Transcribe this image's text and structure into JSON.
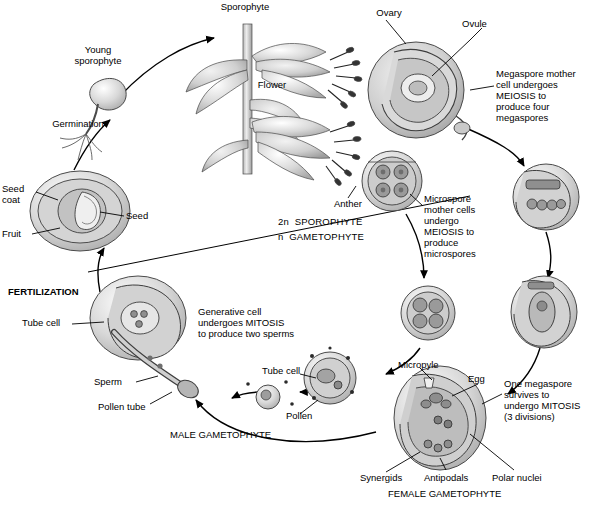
{
  "diagram": {
    "labels": [
      {
        "id": "sporophyte",
        "text": "Sporophyte",
        "x": 210,
        "y": 2,
        "w": 70,
        "align": "center",
        "bold": false,
        "italic": false
      },
      {
        "id": "ovary",
        "text": "Ovary",
        "x": 368,
        "y": 8,
        "w": 42,
        "align": "center",
        "bold": false,
        "italic": false
      },
      {
        "id": "ovule",
        "text": "Ovule",
        "x": 462,
        "y": 19,
        "w": 42,
        "align": "left",
        "bold": false,
        "italic": false
      },
      {
        "id": "young-sporophyte",
        "text": "Young\nsporophyte",
        "x": 63,
        "y": 45,
        "w": 70,
        "align": "center",
        "bold": false,
        "italic": false
      },
      {
        "id": "flower",
        "text": "Flower",
        "x": 248,
        "y": 80,
        "w": 48,
        "align": "center",
        "bold": false,
        "italic": false
      },
      {
        "id": "megaspore-mother-cell",
        "text": "Megaspore mother\ncell undergoes\nMEIOSIS to\nproduce four\nmegaspores",
        "x": 496,
        "y": 69,
        "w": 110,
        "align": "left",
        "bold": false,
        "italic": false
      },
      {
        "id": "germination",
        "text": "Germination",
        "x": 44,
        "y": 119,
        "w": 68,
        "align": "center",
        "bold": false,
        "italic": false
      },
      {
        "id": "seed-coat",
        "text": "Seed\ncoat",
        "x": 2,
        "y": 184,
        "w": 34,
        "align": "left",
        "bold": false,
        "italic": false
      },
      {
        "id": "seed",
        "text": "Seed",
        "x": 126,
        "y": 211,
        "w": 34,
        "align": "left",
        "bold": false,
        "italic": false
      },
      {
        "id": "fruit",
        "text": "Fruit",
        "x": 2,
        "y": 229,
        "w": 30,
        "align": "left",
        "bold": false,
        "italic": false
      },
      {
        "id": "anther",
        "text": "Anther",
        "x": 326,
        "y": 199,
        "w": 44,
        "align": "center",
        "bold": false,
        "italic": false
      },
      {
        "id": "microspore-mother-cells",
        "text": "Microspore\nmother cells\nundergo\nMEIOSIS to\nproduce\nmicrospores",
        "x": 424,
        "y": 194,
        "w": 72,
        "align": "left",
        "bold": false,
        "italic": false
      },
      {
        "id": "sporophyte-level",
        "text": "2n  SPOROPHYTE",
        "x": 278,
        "y": 217,
        "w": 104,
        "align": "left",
        "bold": false,
        "italic": false
      },
      {
        "id": "gametophyte-level",
        "text": "n  GAMETOPHYTE",
        "x": 278,
        "y": 232,
        "w": 104,
        "align": "left",
        "bold": false,
        "italic": false
      },
      {
        "id": "fertilization",
        "text": "FERTILIZATION",
        "x": 8,
        "y": 287,
        "w": 92,
        "align": "left",
        "bold": true,
        "italic": false
      },
      {
        "id": "generative-cell",
        "text": "Generative cell\nundergoes MITOSIS\nto produce two sperms",
        "x": 198,
        "y": 307,
        "w": 116,
        "align": "left",
        "bold": false,
        "italic": false
      },
      {
        "id": "tube-cell-left",
        "text": "Tube cell",
        "x": 22,
        "y": 318,
        "w": 52,
        "align": "left",
        "bold": false,
        "italic": false
      },
      {
        "id": "tube-cell-right",
        "text": "Tube cell",
        "x": 262,
        "y": 366,
        "w": 52,
        "align": "left",
        "bold": false,
        "italic": false
      },
      {
        "id": "micropyle",
        "text": "Micropyle",
        "x": 398,
        "y": 360,
        "w": 58,
        "align": "left",
        "bold": false,
        "italic": false
      },
      {
        "id": "egg",
        "text": "Egg",
        "x": 468,
        "y": 374,
        "w": 28,
        "align": "left",
        "bold": false,
        "italic": false
      },
      {
        "id": "sperm",
        "text": "Sperm",
        "x": 94,
        "y": 377,
        "w": 42,
        "align": "left",
        "bold": false,
        "italic": false
      },
      {
        "id": "one-megaspore",
        "text": "One megaspore\nsurvives to\nundergo MITOSIS\n(3 divisions)",
        "x": 504,
        "y": 379,
        "w": 100,
        "align": "left",
        "bold": false,
        "italic": false
      },
      {
        "id": "pollen-tube",
        "text": "Pollen tube",
        "x": 98,
        "y": 402,
        "w": 64,
        "align": "left",
        "bold": false,
        "italic": false
      },
      {
        "id": "pollen",
        "text": "Pollen",
        "x": 286,
        "y": 411,
        "w": 42,
        "align": "left",
        "bold": false,
        "italic": false
      },
      {
        "id": "male-gametophyte",
        "text": "MALE GAMETOPHYTE",
        "x": 170,
        "y": 430,
        "w": 130,
        "align": "left",
        "bold": false,
        "italic": false
      },
      {
        "id": "synergids",
        "text": "Synergids",
        "x": 360,
        "y": 473,
        "w": 60,
        "align": "left",
        "bold": false,
        "italic": false
      },
      {
        "id": "antipodals",
        "text": "Antipodals",
        "x": 424,
        "y": 473,
        "w": 62,
        "align": "left",
        "bold": false,
        "italic": false
      },
      {
        "id": "polar-nuclei",
        "text": "Polar nuclei",
        "x": 492,
        "y": 473,
        "w": 68,
        "align": "left",
        "bold": false,
        "italic": false
      },
      {
        "id": "female-gametophyte",
        "text": "FEMALE GAMETOPHYTE",
        "x": 388,
        "y": 489,
        "w": 148,
        "align": "left",
        "bold": false,
        "italic": false
      }
    ]
  }
}
